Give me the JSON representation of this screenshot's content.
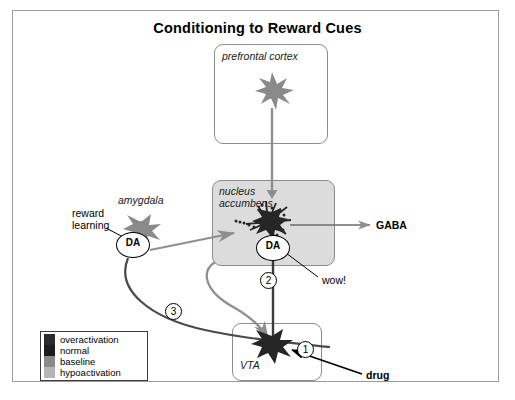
{
  "title": "Conditioning to Reward Cues",
  "regions": {
    "prefrontal_cortex": {
      "label": "prefrontal cortex"
    },
    "nucleus_accumbens": {
      "label": "nucleus\naccumbens"
    },
    "vta": {
      "label": "VTA"
    },
    "amygdala": {
      "label": "amygdala"
    }
  },
  "annotations": {
    "reward_learning": "reward\nlearning",
    "gaba": "GABA",
    "wow": "wow!",
    "drug": "drug",
    "da_amygdala": "DA",
    "da_nucleus_accumbens": "DA"
  },
  "steps": {
    "one": "1",
    "two": "2",
    "three": "3"
  },
  "legend": {
    "items": [
      {
        "label": "overactivation",
        "color": "#2b2b2b"
      },
      {
        "label": "normal",
        "color": "#1c1c1c"
      },
      {
        "label": "baseline",
        "color": "#8a8a8a"
      },
      {
        "label": "hypoactivation",
        "color": "#b5b5b5"
      }
    ]
  },
  "colors": {
    "frame_border": "#9a9a9a",
    "box_border": "#8c8c8c",
    "nac_fill": "#dcdcdc",
    "neuron_dark": "#262626",
    "neuron_gray": "#8a8a8a",
    "pathway_gray": "#8f8f8f",
    "pathway_dark": "#4a4a4a",
    "arrow_black": "#000000"
  }
}
